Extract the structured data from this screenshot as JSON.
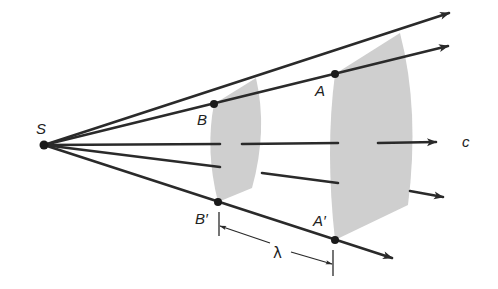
{
  "diagram": {
    "colors": {
      "line": "#2a2a2a",
      "wavefront_fill": "#cfcfcf",
      "background": "#ffffff"
    },
    "source": {
      "label": "S",
      "x": 44,
      "y": 145
    },
    "rays": [
      {
        "id": "ray-1",
        "tip": [
          449,
          13
        ]
      },
      {
        "id": "ray-2",
        "tip": [
          448,
          46
        ]
      },
      {
        "id": "ray-3",
        "tip": [
          436,
          142
        ],
        "label": "c"
      },
      {
        "id": "ray-4",
        "tip": [
          443,
          197
        ]
      },
      {
        "id": "ray-5",
        "tip": [
          392,
          258
        ]
      }
    ],
    "points": {
      "B": {
        "label": "B",
        "x": 214,
        "y": 104
      },
      "B_prime": {
        "label": "B′",
        "x": 218,
        "y": 202
      },
      "A": {
        "label": "A",
        "x": 335,
        "y": 74
      },
      "A_prime": {
        "label": "A′",
        "x": 335,
        "y": 240
      }
    },
    "wavelength": {
      "label": "λ"
    },
    "speed_label": "c"
  }
}
